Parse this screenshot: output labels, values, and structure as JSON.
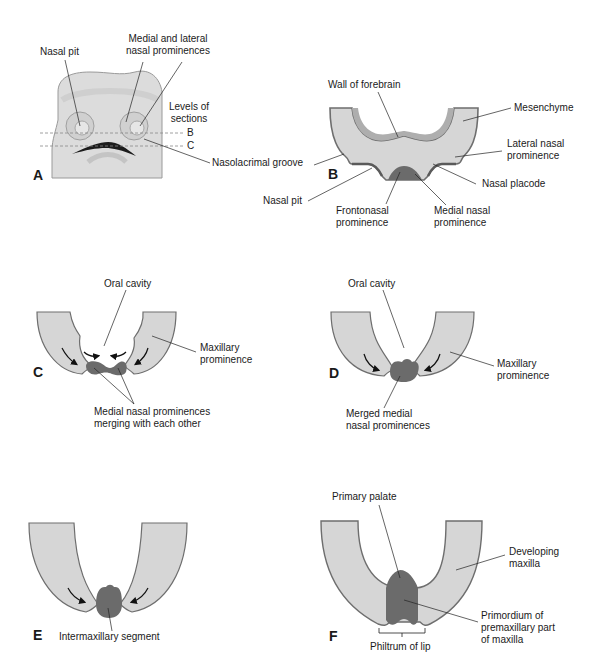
{
  "figure": {
    "colors": {
      "mesenchyme": "#d6d6d6",
      "outline": "#6e6e6e",
      "forebrain_wall": "#aeaeae",
      "medial_nasal": "#6b6b6b",
      "face_fill": "#dcdcdc",
      "text": "#1a1a1a"
    }
  },
  "panels": {
    "A": {
      "letter": "A",
      "labels": {
        "nasal_pit": "Nasal pit",
        "prominences": "Medial and lateral\nnasal prominences",
        "levels": "Levels of\nsections",
        "level_b": "B",
        "level_c": "C",
        "nasolacrimal": "Nasolacrimal groove"
      }
    },
    "B": {
      "letter": "B",
      "labels": {
        "wall_forebrain": "Wall of forebrain",
        "mesenchyme": "Mesenchyme",
        "lateral_nasal": "Lateral nasal\nprominence",
        "nasal_placode": "Nasal placode",
        "nasal_pit": "Nasal pit",
        "frontonasal": "Frontonasal\nprominence",
        "medial_nasal": "Medial nasal\nprominence"
      }
    },
    "C": {
      "letter": "C",
      "labels": {
        "oral_cavity": "Oral cavity",
        "maxillary": "Maxillary\nprominence",
        "merging": "Medial nasal prominences\nmerging with each other"
      }
    },
    "D": {
      "letter": "D",
      "labels": {
        "oral_cavity": "Oral cavity",
        "maxillary": "Maxillary\nprominence",
        "merged": "Merged medial\nnasal prominences"
      }
    },
    "E": {
      "letter": "E",
      "labels": {
        "intermaxillary": "Intermaxillary segment"
      }
    },
    "F": {
      "letter": "F",
      "labels": {
        "primary_palate": "Primary palate",
        "developing_maxilla": "Developing\nmaxilla",
        "premaxillary": "Primordium of\npremaxillary part\nof maxilla",
        "philtrum": "Philtrum of lip"
      }
    }
  }
}
